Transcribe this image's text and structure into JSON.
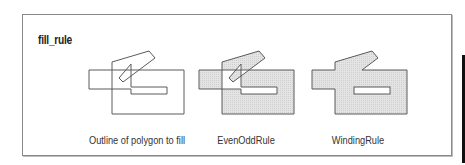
{
  "title": "fill_rule",
  "panels": [
    {
      "id": "outline",
      "label": "Outline of polygon to fill",
      "label_x": 137,
      "offset_x": 0,
      "fill": "none",
      "fill_rule": "none"
    },
    {
      "id": "evenodd",
      "label": "EvenOddRule",
      "label_x": 246,
      "offset_x": 110,
      "fill": "#dedede",
      "fill_rule": "evenodd"
    },
    {
      "id": "winding",
      "label": "WindingRule",
      "label_x": 358,
      "offset_x": 223,
      "fill": "#dedede",
      "fill_rule": "nonzero"
    }
  ],
  "colors": {
    "stroke": "#5a5a5a",
    "fill": "#dedede",
    "frame": "#8a8a8a",
    "bar": "#111111"
  }
}
